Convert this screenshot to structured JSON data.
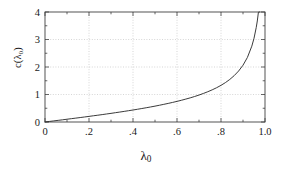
{
  "chart_data": {
    "type": "line",
    "title": "",
    "xlabel": "λ₀",
    "ylabel": "c(λ₀)",
    "xlabel_base": "λ",
    "xlabel_sub": "0",
    "ylabel_text": "c(λ₀)",
    "xlim": [
      0,
      1.0
    ],
    "ylim": [
      0,
      4
    ],
    "grid": true,
    "grid_style": "dotted",
    "legend": "none",
    "line_color": "#303030",
    "frame_color": "#404040",
    "grid_color": "#bbbbbb",
    "background": "#ffffff",
    "xticks": [
      0,
      0.2,
      0.4,
      0.6,
      0.8,
      1.0
    ],
    "xticklabels": [
      "0",
      ".2",
      ".4",
      ".6",
      ".8",
      "1.0"
    ],
    "xminorticks": [
      0.1,
      0.3,
      0.5,
      0.7,
      0.9
    ],
    "yticks": [
      0,
      1,
      2,
      3,
      4
    ],
    "yticklabels": [
      "0",
      "1",
      "2",
      "3",
      "4"
    ],
    "yminorticks": [
      0.5,
      1.5,
      2.5,
      3.5
    ],
    "series": [
      {
        "name": "c(λ₀)",
        "x": [
          0.0,
          0.02,
          0.04,
          0.06,
          0.08,
          0.1,
          0.12,
          0.14,
          0.16,
          0.18,
          0.2,
          0.22,
          0.24,
          0.26,
          0.28,
          0.3,
          0.32,
          0.34,
          0.36,
          0.38,
          0.4,
          0.42,
          0.44,
          0.46,
          0.48,
          0.5,
          0.52,
          0.54,
          0.56,
          0.58,
          0.6,
          0.62,
          0.64,
          0.66,
          0.68,
          0.7,
          0.72,
          0.74,
          0.76,
          0.78,
          0.8,
          0.82,
          0.84,
          0.86,
          0.88,
          0.9,
          0.92,
          0.94,
          0.95,
          0.96,
          0.965,
          0.97,
          0.975,
          0.98,
          0.982,
          0.984,
          0.986,
          0.988,
          0.99,
          0.991,
          0.992,
          0.993,
          0.994,
          0.995,
          0.9955,
          0.996,
          0.9965,
          0.997
        ],
        "values": [
          0.0,
          0.02,
          0.04,
          0.06,
          0.08,
          0.101,
          0.121,
          0.141,
          0.162,
          0.183,
          0.204,
          0.226,
          0.247,
          0.269,
          0.292,
          0.314,
          0.338,
          0.362,
          0.386,
          0.411,
          0.436,
          0.463,
          0.49,
          0.518,
          0.547,
          0.577,
          0.609,
          0.642,
          0.676,
          0.712,
          0.75,
          0.79,
          0.833,
          0.878,
          0.927,
          0.98,
          1.038,
          1.101,
          1.17,
          1.246,
          1.333,
          1.432,
          1.548,
          1.686,
          1.854,
          2.065,
          2.347,
          2.757,
          3.043,
          3.429,
          3.673,
          3.99,
          4.0,
          4.0,
          4.0,
          4.0,
          4.0,
          4.0,
          4.0,
          4.0,
          4.0,
          4.0,
          4.0,
          4.0,
          4.0,
          4.0,
          4.0,
          4.0
        ]
      }
    ]
  },
  "figure": {
    "plot_area": {
      "left": 45,
      "top": 12,
      "right": 265,
      "bottom": 122
    }
  }
}
